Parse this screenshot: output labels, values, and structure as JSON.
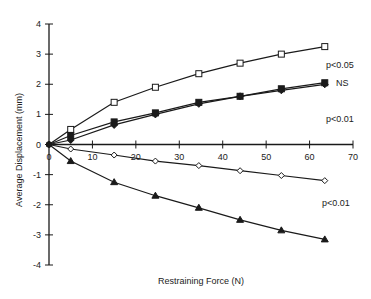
{
  "chart_data": {
    "type": "line",
    "title": "",
    "xlabel": "Restraining Force (N)",
    "ylabel": "Average Displacement (mm)",
    "xlim": [
      0,
      70
    ],
    "ylim": [
      -4,
      4
    ],
    "xticks": [
      0,
      10,
      20,
      30,
      40,
      50,
      60,
      70
    ],
    "yticks": [
      4,
      3,
      2,
      1,
      0,
      -1,
      -2,
      -3,
      -4
    ],
    "grid": false,
    "legend": "none",
    "series": [
      {
        "name": "open-square",
        "marker": "open-square",
        "x": [
          0,
          5,
          15,
          24.5,
          34.5,
          44,
          53.5,
          63.5
        ],
        "y": [
          0,
          0.5,
          1.4,
          1.9,
          2.35,
          2.7,
          3.0,
          3.25
        ]
      },
      {
        "name": "filled-square",
        "marker": "filled-square",
        "x": [
          0,
          5,
          15,
          24.5,
          34.5,
          44,
          53.5,
          63.5
        ],
        "y": [
          0,
          0.3,
          0.75,
          1.05,
          1.4,
          1.6,
          1.85,
          2.05
        ]
      },
      {
        "name": "filled-diamond",
        "marker": "filled-diamond",
        "x": [
          0,
          5,
          15,
          24.5,
          34.5,
          44,
          53.5,
          63.5
        ],
        "y": [
          0,
          0.15,
          0.65,
          1.0,
          1.35,
          1.6,
          1.8,
          2.0
        ]
      },
      {
        "name": "open-diamond",
        "marker": "open-diamond",
        "x": [
          0,
          5,
          15,
          24.5,
          34.5,
          44,
          53.5,
          63.5
        ],
        "y": [
          0,
          -0.15,
          -0.35,
          -0.55,
          -0.7,
          -0.87,
          -1.03,
          -1.2
        ]
      },
      {
        "name": "filled-triangle",
        "marker": "filled-triangle",
        "x": [
          0,
          5,
          15,
          24.5,
          34.5,
          44,
          53.5,
          63.5
        ],
        "y": [
          0,
          -0.55,
          -1.25,
          -1.7,
          -2.1,
          -2.5,
          -2.85,
          -3.15
        ]
      }
    ],
    "annotations": [
      {
        "text": "p<0.05",
        "x": 65,
        "y": 2.6
      },
      {
        "text": "NS",
        "x": 66,
        "y": 2.0
      },
      {
        "text": "p<0.01",
        "x": 65,
        "y": 0.75
      },
      {
        "text": "p<0.01",
        "x": 65,
        "y": -1.7
      }
    ]
  },
  "labels": {
    "xlabel": "Restraining Force (N)",
    "ylabel": "Average Displacement (mm)",
    "annot_p005": "p<0.05",
    "annot_ns": "NS",
    "annot_p001_upper": "p<0.01",
    "annot_p001_lower": "p<0.01"
  },
  "colors": {
    "ink": "#1a1a1a",
    "background": "#ffffff"
  }
}
